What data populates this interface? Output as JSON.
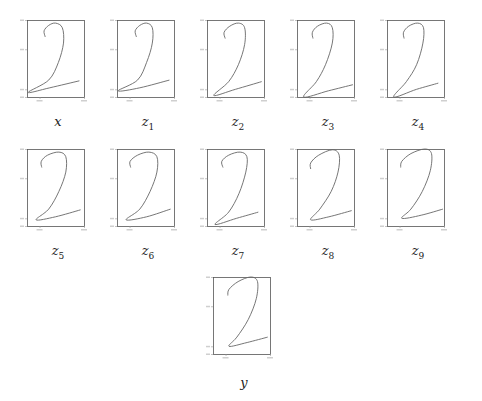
{
  "figure": {
    "rows": 3
  },
  "panels": [
    {
      "id": "x",
      "label_main": "x",
      "label_sub": ""
    },
    {
      "id": "z1",
      "label_main": "z",
      "label_sub": "1"
    },
    {
      "id": "z2",
      "label_main": "z",
      "label_sub": "2"
    },
    {
      "id": "z3",
      "label_main": "z",
      "label_sub": "3"
    },
    {
      "id": "z4",
      "label_main": "z",
      "label_sub": "4"
    },
    {
      "id": "z5",
      "label_main": "z",
      "label_sub": "5"
    },
    {
      "id": "z6",
      "label_main": "z",
      "label_sub": "6"
    },
    {
      "id": "z7",
      "label_main": "z",
      "label_sub": "7"
    },
    {
      "id": "z8",
      "label_main": "z",
      "label_sub": "8"
    },
    {
      "id": "z9",
      "label_main": "z",
      "label_sub": "9"
    },
    {
      "id": "y",
      "label_main": "y",
      "label_sub": ""
    }
  ],
  "colors": {
    "axis": "#555555",
    "curve": "#666666",
    "label": "#222222"
  },
  "chart_data": [
    {
      "type": "line",
      "title": "x",
      "grid": false,
      "xlim": [
        0,
        1
      ],
      "ylim": [
        0,
        1
      ],
      "points": [
        [
          0.32,
          0.78
        ],
        [
          0.3,
          0.86
        ],
        [
          0.38,
          0.93
        ],
        [
          0.5,
          0.96
        ],
        [
          0.62,
          0.9
        ],
        [
          0.64,
          0.7
        ],
        [
          0.55,
          0.45
        ],
        [
          0.38,
          0.22
        ],
        [
          0.02,
          0.06
        ],
        [
          0.4,
          0.12
        ],
        [
          0.92,
          0.21
        ]
      ]
    },
    {
      "type": "line",
      "title": "z1",
      "grid": false,
      "xlim": [
        0,
        1
      ],
      "ylim": [
        0,
        1
      ],
      "points": [
        [
          0.34,
          0.78
        ],
        [
          0.32,
          0.86
        ],
        [
          0.4,
          0.93
        ],
        [
          0.52,
          0.96
        ],
        [
          0.62,
          0.9
        ],
        [
          0.62,
          0.7
        ],
        [
          0.52,
          0.45
        ],
        [
          0.36,
          0.22
        ],
        [
          0.02,
          0.08
        ],
        [
          0.4,
          0.12
        ],
        [
          0.92,
          0.22
        ]
      ]
    },
    {
      "type": "line",
      "title": "z2",
      "grid": false,
      "xlim": [
        0,
        1
      ],
      "ylim": [
        0,
        1
      ],
      "points": [
        [
          0.32,
          0.76
        ],
        [
          0.3,
          0.84
        ],
        [
          0.4,
          0.92
        ],
        [
          0.55,
          0.96
        ],
        [
          0.66,
          0.9
        ],
        [
          0.66,
          0.68
        ],
        [
          0.55,
          0.42
        ],
        [
          0.38,
          0.2
        ],
        [
          0.12,
          0.02
        ],
        [
          0.5,
          0.1
        ],
        [
          0.96,
          0.2
        ]
      ]
    },
    {
      "type": "line",
      "title": "z3",
      "grid": false,
      "xlim": [
        0,
        1
      ],
      "ylim": [
        0,
        1
      ],
      "points": [
        [
          0.28,
          0.76
        ],
        [
          0.27,
          0.84
        ],
        [
          0.36,
          0.92
        ],
        [
          0.52,
          0.96
        ],
        [
          0.62,
          0.9
        ],
        [
          0.62,
          0.7
        ],
        [
          0.5,
          0.42
        ],
        [
          0.34,
          0.2
        ],
        [
          0.12,
          0.0
        ],
        [
          0.55,
          0.08
        ],
        [
          0.98,
          0.16
        ]
      ]
    },
    {
      "type": "line",
      "title": "z4",
      "grid": false,
      "xlim": [
        0,
        1
      ],
      "ylim": [
        0,
        1
      ],
      "points": [
        [
          0.3,
          0.76
        ],
        [
          0.29,
          0.84
        ],
        [
          0.38,
          0.92
        ],
        [
          0.54,
          0.96
        ],
        [
          0.64,
          0.9
        ],
        [
          0.63,
          0.7
        ],
        [
          0.52,
          0.42
        ],
        [
          0.34,
          0.2
        ],
        [
          0.12,
          0.0
        ],
        [
          0.52,
          0.1
        ],
        [
          0.9,
          0.18
        ]
      ]
    },
    {
      "type": "line",
      "title": "z5",
      "grid": false,
      "xlim": [
        0,
        1
      ],
      "ylim": [
        0,
        1
      ],
      "points": [
        [
          0.26,
          0.76
        ],
        [
          0.25,
          0.84
        ],
        [
          0.36,
          0.92
        ],
        [
          0.56,
          0.96
        ],
        [
          0.68,
          0.9
        ],
        [
          0.68,
          0.7
        ],
        [
          0.56,
          0.45
        ],
        [
          0.38,
          0.22
        ],
        [
          0.16,
          0.08
        ],
        [
          0.5,
          0.12
        ],
        [
          0.94,
          0.21
        ]
      ]
    },
    {
      "type": "line",
      "title": "z6",
      "grid": false,
      "xlim": [
        0,
        1
      ],
      "ylim": [
        0,
        1
      ],
      "points": [
        [
          0.24,
          0.76
        ],
        [
          0.23,
          0.84
        ],
        [
          0.36,
          0.92
        ],
        [
          0.56,
          0.96
        ],
        [
          0.7,
          0.9
        ],
        [
          0.7,
          0.7
        ],
        [
          0.58,
          0.45
        ],
        [
          0.4,
          0.22
        ],
        [
          0.16,
          0.08
        ],
        [
          0.52,
          0.12
        ],
        [
          0.94,
          0.22
        ]
      ]
    },
    {
      "type": "line",
      "title": "z7",
      "grid": false,
      "xlim": [
        0,
        1
      ],
      "ylim": [
        0,
        1
      ],
      "points": [
        [
          0.28,
          0.76
        ],
        [
          0.26,
          0.84
        ],
        [
          0.38,
          0.92
        ],
        [
          0.58,
          0.96
        ],
        [
          0.7,
          0.9
        ],
        [
          0.68,
          0.7
        ],
        [
          0.56,
          0.42
        ],
        [
          0.38,
          0.18
        ],
        [
          0.14,
          0.02
        ],
        [
          0.52,
          0.1
        ],
        [
          0.9,
          0.18
        ]
      ]
    },
    {
      "type": "line",
      "title": "z8",
      "grid": false,
      "xlim": [
        0,
        1
      ],
      "ylim": [
        0,
        1
      ],
      "points": [
        [
          0.24,
          0.74
        ],
        [
          0.24,
          0.82
        ],
        [
          0.38,
          0.92
        ],
        [
          0.62,
          0.99
        ],
        [
          0.74,
          0.92
        ],
        [
          0.72,
          0.7
        ],
        [
          0.6,
          0.45
        ],
        [
          0.4,
          0.22
        ],
        [
          0.24,
          0.08
        ],
        [
          0.56,
          0.12
        ],
        [
          0.96,
          0.2
        ]
      ]
    },
    {
      "type": "line",
      "title": "z9",
      "grid": false,
      "xlim": [
        0,
        1
      ],
      "ylim": [
        0,
        1
      ],
      "points": [
        [
          0.24,
          0.76
        ],
        [
          0.26,
          0.84
        ],
        [
          0.42,
          0.94
        ],
        [
          0.66,
          1.0
        ],
        [
          0.78,
          0.94
        ],
        [
          0.76,
          0.72
        ],
        [
          0.62,
          0.45
        ],
        [
          0.42,
          0.22
        ],
        [
          0.26,
          0.1
        ],
        [
          0.6,
          0.14
        ],
        [
          0.98,
          0.22
        ]
      ]
    },
    {
      "type": "line",
      "title": "y",
      "grid": false,
      "xlim": [
        0,
        1
      ],
      "ylim": [
        0,
        1
      ],
      "points": [
        [
          0.26,
          0.76
        ],
        [
          0.28,
          0.84
        ],
        [
          0.44,
          0.94
        ],
        [
          0.66,
          1.0
        ],
        [
          0.78,
          0.94
        ],
        [
          0.76,
          0.72
        ],
        [
          0.62,
          0.45
        ],
        [
          0.42,
          0.22
        ],
        [
          0.28,
          0.1
        ],
        [
          0.6,
          0.15
        ],
        [
          0.96,
          0.22
        ]
      ]
    }
  ]
}
